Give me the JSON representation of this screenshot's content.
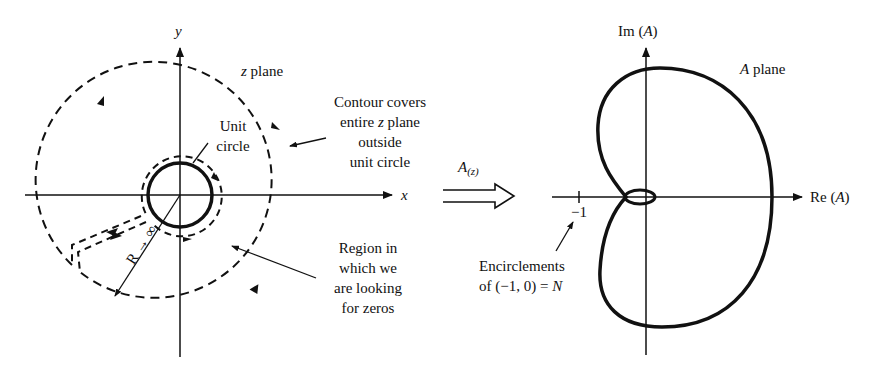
{
  "z_plane": {
    "y_axis_label": "y",
    "x_axis_label": "x",
    "plane_label_var": "z",
    "plane_label_text": " plane",
    "unit_circle_label_1": "Unit",
    "unit_circle_label_2": "circle",
    "contour_note": [
      "Contour covers",
      "entire ",
      "z",
      " plane",
      "outside",
      "unit circle"
    ],
    "region_note": [
      "Region in",
      "which we",
      "are looking",
      "for zeros"
    ],
    "radius_label": "R → ∞"
  },
  "mapping": {
    "function_label": "A",
    "function_sub": "(z)"
  },
  "a_plane": {
    "im_axis_label": "Im (",
    "im_axis_var": "A",
    "im_axis_close": ")",
    "re_axis_label": "Re (",
    "re_axis_var": "A",
    "re_axis_close": ")",
    "plane_label_var": "A",
    "plane_label_text": " plane",
    "tick_label": "−1",
    "encirclement_note_1": "Encirclements",
    "encirclement_note_2": "of (−1, 0) = ",
    "encirclement_note_var": "N"
  },
  "colors": {
    "ink": "#111111",
    "background": "#ffffff"
  }
}
